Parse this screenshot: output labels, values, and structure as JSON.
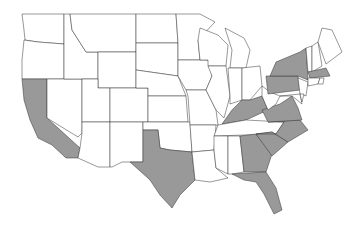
{
  "map": {
    "title": "United States (contiguous) — highlighted states",
    "colors": {
      "highlight": "#999999",
      "default": "#ffffff",
      "border": "#333333"
    },
    "highlighted_states": [
      "CA",
      "TX",
      "KY",
      "VA",
      "NC",
      "SC",
      "GA",
      "FL",
      "PA",
      "NY",
      "MA"
    ],
    "states": [
      {
        "id": "WA",
        "points": "22,14 64,14 64,44 38,42 25,40 24,30"
      },
      {
        "id": "OR",
        "points": "24,40 38,42 64,44 64,79 22,79 22,60"
      },
      {
        "id": "CA",
        "points": "22,79 47,79 47,118 80,148 78,158 66,158 52,145 38,138 30,120 24,100"
      },
      {
        "id": "NV",
        "points": "47,79 82,79 82,133 78,137 47,118"
      },
      {
        "id": "ID",
        "points": "64,14 70,14 72,30 86,52 98,52 98,79 64,79"
      },
      {
        "id": "MT",
        "points": "70,14 136,14 136,52 98,52 86,52 72,30"
      },
      {
        "id": "WY",
        "points": "98,52 136,52 136,88 98,88"
      },
      {
        "id": "UT",
        "points": "82,79 98,79 98,88 110,88 110,122 82,122"
      },
      {
        "id": "AZ",
        "points": "82,122 110,122 110,167 98,167 78,158 80,148 82,133"
      },
      {
        "id": "CO",
        "points": "110,88 148,88 148,122 110,122"
      },
      {
        "id": "NM",
        "points": "110,122 143,122 143,162 122,162 112,167 110,167"
      },
      {
        "id": "ND",
        "points": "136,14 176,14 178,43 136,43"
      },
      {
        "id": "SD",
        "points": "136,43 178,43 178,76 136,70"
      },
      {
        "id": "NE",
        "points": "136,70 178,76 186,96 148,96 148,88 136,88"
      },
      {
        "id": "KS",
        "points": "148,96 186,96 188,122 148,122"
      },
      {
        "id": "OK",
        "points": "143,122 190,122 192,152 170,150 160,148 158,130 143,130"
      },
      {
        "id": "TX",
        "points": "143,130 158,130 160,148 170,150 192,152 195,180 180,195 172,208 160,195 150,180 130,162 143,162"
      },
      {
        "id": "MN",
        "points": "176,14 200,14 215,22 198,40 200,60 178,60 178,43"
      },
      {
        "id": "IA",
        "points": "178,60 208,60 212,76 206,90 186,90 178,76"
      },
      {
        "id": "MO",
        "points": "186,90 206,90 216,110 218,125 190,125 188,96"
      },
      {
        "id": "AR",
        "points": "190,125 216,125 214,150 192,152"
      },
      {
        "id": "LA",
        "points": "192,152 214,150 216,168 228,178 210,182 195,180"
      },
      {
        "id": "WI",
        "points": "200,28 218,35 228,45 226,66 208,66 208,60 200,60 198,40"
      },
      {
        "id": "IL",
        "points": "208,66 226,66 230,96 224,118 216,110 206,90 212,76"
      },
      {
        "id": "MI",
        "points": "225,28 244,38 250,50 246,68 230,68 232,50"
      },
      {
        "id": "IN",
        "points": "228,68 242,68 242,100 230,104 230,96"
      },
      {
        "id": "OH",
        "points": "242,68 260,66 262,86 250,100 242,100"
      },
      {
        "id": "KY",
        "points": "222,124 232,110 242,100 250,100 262,96 268,110 246,120"
      },
      {
        "id": "TN",
        "points": "218,125 246,120 284,122 276,134 214,136"
      },
      {
        "id": "MS",
        "points": "214,136 228,136 228,174 216,168 214,150"
      },
      {
        "id": "AL",
        "points": "228,136 240,136 244,172 232,174 228,174"
      },
      {
        "id": "GA",
        "points": "240,136 256,134 272,154 266,172 244,172"
      },
      {
        "id": "FL",
        "points": "232,174 266,172 276,188 282,210 274,214 264,194 256,182 244,180"
      },
      {
        "id": "SC",
        "points": "256,134 272,132 288,142 272,156"
      },
      {
        "id": "NC",
        "points": "268,122 300,120 308,130 288,142 272,132 256,134 276,134 284,122"
      },
      {
        "id": "VA",
        "points": "262,110 280,104 292,96 298,108 302,120 268,122"
      },
      {
        "id": "WV",
        "points": "262,86 270,92 280,96 276,104 268,110 262,96"
      },
      {
        "id": "MD",
        "points": "280,96 300,94 302,104 292,96"
      },
      {
        "id": "PA",
        "points": "266,76 298,76 300,90 268,94"
      },
      {
        "id": "NY",
        "points": "276,62 300,52 306,48 308,80 298,76 270,76"
      },
      {
        "id": "NJ",
        "points": "298,78 308,82 306,96 300,94"
      },
      {
        "id": "VT",
        "points": "306,48 312,46 312,72 308,72"
      },
      {
        "id": "NH",
        "points": "312,46 318,42 322,66 312,72"
      },
      {
        "id": "ME",
        "points": "318,42 322,28 332,30 342,52 326,64"
      },
      {
        "id": "MA",
        "points": "308,72 326,68 330,76 310,78"
      },
      {
        "id": "CT",
        "points": "308,78 320,78 318,84 308,86"
      },
      {
        "id": "RI",
        "points": "320,78 324,78 323,84 318,84"
      },
      {
        "id": "DE",
        "points": "300,94 304,94 302,102"
      }
    ]
  }
}
